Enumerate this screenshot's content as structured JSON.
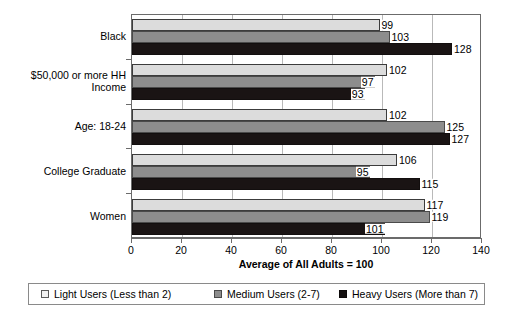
{
  "chart_data": {
    "type": "bar",
    "orientation": "horizontal",
    "title": "",
    "xlabel": "Average of All Adults = 100",
    "ylabel": "",
    "xlim": [
      0,
      140
    ],
    "xticks": [
      0,
      20,
      40,
      60,
      80,
      100,
      120,
      140
    ],
    "grid": true,
    "legend_position": "bottom",
    "categories": [
      "Black",
      "$50,000 or more HH Income",
      "Age: 18-24",
      "College Graduate",
      "Women"
    ],
    "series": [
      {
        "name": "Light Users (Less than 2)",
        "color": "#dcdcdc",
        "values": [
          99,
          102,
          102,
          106,
          117
        ]
      },
      {
        "name": "Medium Users (2-7)",
        "color": "#8d8d8d",
        "values": [
          103,
          97,
          125,
          95,
          119
        ]
      },
      {
        "name": "Heavy Users (More than 7)",
        "color": "#1a1414",
        "values": [
          128,
          93,
          127,
          115,
          101
        ]
      }
    ]
  },
  "axis": {
    "x_tick_labels": [
      "0",
      "20",
      "40",
      "60",
      "80",
      "100",
      "120",
      "140"
    ],
    "x_title": "Average of All Adults = 100",
    "y_tick_labels": [
      "Black",
      "$50,000 or more HH\nIncome",
      "Age: 18-24",
      "College Graduate",
      "Women"
    ]
  },
  "legend": {
    "items": [
      {
        "label": "Light Users (Less than 2)",
        "swatch": "light-swatch"
      },
      {
        "label": "Medium Users (2-7)",
        "swatch": "medium-swatch"
      },
      {
        "label": "Heavy Users (More than 7)",
        "swatch": "heavy-swatch"
      }
    ]
  },
  "values_flat": {
    "black": {
      "light": "99",
      "medium": "103",
      "heavy": "128"
    },
    "income_50k": {
      "light": "102",
      "medium": "97",
      "heavy": "93"
    },
    "age_18_24": {
      "light": "102",
      "medium": "125",
      "heavy": "127"
    },
    "college_grad": {
      "light": "106",
      "medium": "95",
      "heavy": "115"
    },
    "women": {
      "light": "117",
      "medium": "119",
      "heavy": "101"
    }
  }
}
